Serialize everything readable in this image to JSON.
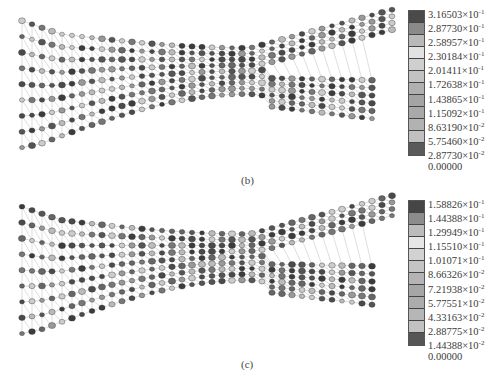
{
  "figure": {
    "panels": [
      {
        "id": "b",
        "caption": "(b)",
        "legend": {
          "labels": [
            "3.16503×10^-1",
            "2.87730×10^-1",
            "2.58957×10^-1",
            "2.30184×10^-1",
            "2.01411×10^-1",
            "1.72638×10^-1",
            "1.43865×10^-1",
            "1.15092×10^-1",
            "8.63190×10^-2",
            "5.75460×10^-2",
            "2.87730×10^-2",
            "0.00000"
          ],
          "colors": [
            "#4a4a4a",
            "#8a8a8a",
            "#b9b9b9",
            "#e2e2e2",
            "#cfcfcf",
            "#c2c2c2",
            "#b0b0b0",
            "#a4a4a4",
            "#a9a9a9",
            "#b2b2b2",
            "#c0c0c0",
            "#5a5a5a"
          ]
        }
      },
      {
        "id": "c",
        "caption": "(c)",
        "legend": {
          "labels": [
            "1.58826×10^-1",
            "1.44388×10^-1",
            "1.29949×10^-1",
            "1.15510×10^-1",
            "1.01071×10^-1",
            "8.66326×10^-2",
            "7.21938×10^-2",
            "5.77551×10^-2",
            "4.33163×10^-2",
            "2.88775×10^-2",
            "1.44388×10^-2",
            "0.00000"
          ],
          "colors": [
            "#464646",
            "#8c8c8c",
            "#bcbcbc",
            "#e6e6e6",
            "#d2d2d2",
            "#c4c4c4",
            "#b4b4b4",
            "#a6a6a6",
            "#acacac",
            "#b6b6b6",
            "#c2c2c2",
            "#565656"
          ]
        }
      }
    ]
  },
  "chart_data": [
    {
      "type": "heatmap",
      "title": "(b)",
      "description": "Finite element mesh contour plot of a Y-shaped (bifurcating) structure with nodal values in grayscale",
      "colorbar": {
        "min": 0.0,
        "max": 0.316503,
        "levels": [
          0.316503,
          0.28773,
          0.258957,
          0.230184,
          0.201411,
          0.172638,
          0.143865,
          0.115092,
          0.086319,
          0.057546,
          0.028773,
          0.0
        ],
        "position": "right"
      }
    },
    {
      "type": "heatmap",
      "title": "(c)",
      "description": "Finite element mesh contour plot of a Y-shaped (bifurcating) structure with nodal values in grayscale",
      "colorbar": {
        "min": 0.0,
        "max": 0.158826,
        "levels": [
          0.158826,
          0.144388,
          0.129949,
          0.11551,
          0.101071,
          0.0866326,
          0.0721938,
          0.0577551,
          0.0433163,
          0.0288775,
          0.0144388,
          0.0
        ],
        "position": "right"
      }
    }
  ]
}
